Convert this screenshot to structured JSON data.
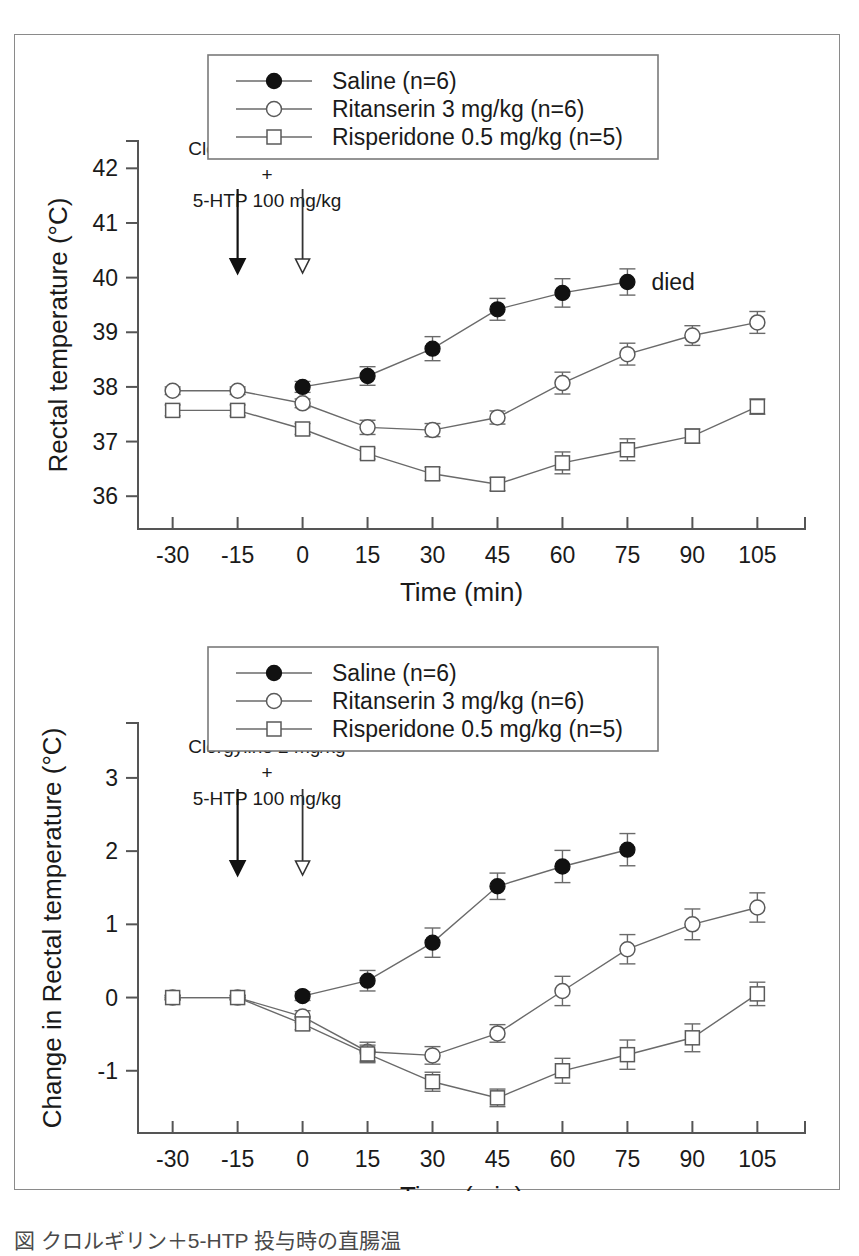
{
  "figure": {
    "caption_partial": "図  クロルギリン＋5-HTP 投与時の直腸温"
  },
  "chart_data": [
    {
      "id": "top",
      "type": "line",
      "title": "",
      "xlabel": "Time (min)",
      "ylabel": "Rectal temperature (°C)",
      "x": [
        -30,
        -15,
        0,
        15,
        30,
        45,
        60,
        75,
        90,
        105
      ],
      "xtick_labels": [
        "-30",
        "-15",
        "0",
        "15",
        "30",
        "45",
        "60",
        "75",
        "90",
        "105"
      ],
      "ytick_labels": [
        "36",
        "37",
        "38",
        "39",
        "40",
        "41",
        "42"
      ],
      "yticks": [
        36,
        37,
        38,
        39,
        40,
        41,
        42
      ],
      "xlim": [
        -38,
        116
      ],
      "ylim": [
        35.4,
        42.5
      ],
      "grid": false,
      "legend_position": "top-center",
      "series": [
        {
          "name": "Saline (n=6)",
          "marker": "filled-circle",
          "x": [
            0,
            15,
            30,
            45,
            60,
            75
          ],
          "values": [
            38.0,
            38.2,
            38.7,
            39.42,
            39.72,
            39.92
          ],
          "errors": [
            0.1,
            0.17,
            0.22,
            0.2,
            0.26,
            0.24
          ]
        },
        {
          "name": "Ritanserin 3 mg/kg (n=6)",
          "marker": "open-circle",
          "x": [
            -30,
            -15,
            0,
            15,
            30,
            45,
            60,
            75,
            90,
            105
          ],
          "values": [
            37.93,
            37.93,
            37.7,
            37.26,
            37.21,
            37.44,
            38.07,
            38.6,
            38.94,
            39.18
          ],
          "errors": [
            0.07,
            0.07,
            0.08,
            0.13,
            0.12,
            0.12,
            0.2,
            0.2,
            0.18,
            0.2
          ]
        },
        {
          "name": "Risperidone 0.5 mg/kg (n=5)",
          "marker": "open-square",
          "x": [
            -30,
            -15,
            0,
            15,
            30,
            45,
            60,
            75,
            90,
            105
          ],
          "values": [
            37.57,
            37.57,
            37.23,
            36.78,
            36.41,
            36.22,
            36.61,
            36.85,
            37.1,
            37.64
          ],
          "errors": [
            0.1,
            0.1,
            0.1,
            0.1,
            0.12,
            0.12,
            0.2,
            0.2,
            0.13,
            0.14
          ]
        }
      ],
      "annotations": [
        {
          "name": "drug-label",
          "text_lines": [
            "Clorgyline 2 mg/kg",
            "+",
            "5-HTP 100 mg/kg"
          ]
        },
        {
          "name": "died-label",
          "text": "died",
          "at_x": 75,
          "at_y": 39.92
        }
      ],
      "arrows": [
        {
          "name": "arrow-pretreatment",
          "style": "solid",
          "x": -15
        },
        {
          "name": "arrow-challenge",
          "style": "open",
          "x": 0
        }
      ]
    },
    {
      "id": "bottom",
      "type": "line",
      "title": "",
      "xlabel": "Time (min)",
      "ylabel": "Change in Rectal temperature (°C)",
      "x": [
        -30,
        -15,
        0,
        15,
        30,
        45,
        60,
        75,
        90,
        105
      ],
      "xtick_labels": [
        "-30",
        "-15",
        "0",
        "15",
        "30",
        "45",
        "60",
        "75",
        "90",
        "105"
      ],
      "ytick_labels": [
        "-1",
        "0",
        "1",
        "2",
        "3"
      ],
      "yticks": [
        -1,
        0,
        1,
        2,
        3
      ],
      "xlim": [
        -38,
        116
      ],
      "ylim": [
        -1.85,
        3.75
      ],
      "grid": false,
      "legend_position": "top-center",
      "series": [
        {
          "name": "Saline (n=6)",
          "marker": "filled-circle",
          "x": [
            0,
            15,
            30,
            45,
            60,
            75
          ],
          "values": [
            0.02,
            0.23,
            0.75,
            1.52,
            1.79,
            2.02
          ],
          "errors": [
            0.06,
            0.14,
            0.2,
            0.18,
            0.22,
            0.22
          ]
        },
        {
          "name": "Ritanserin 3 mg/kg (n=6)",
          "marker": "open-circle",
          "x": [
            -30,
            -15,
            0,
            15,
            30,
            45,
            60,
            75,
            90,
            105
          ],
          "values": [
            0.0,
            0.0,
            -0.26,
            -0.74,
            -0.79,
            -0.49,
            0.09,
            0.66,
            1.0,
            1.23
          ],
          "errors": [
            0.03,
            0.03,
            0.08,
            0.13,
            0.12,
            0.12,
            0.2,
            0.2,
            0.21,
            0.2
          ]
        },
        {
          "name": "Risperidone 0.5 mg/kg (n=5)",
          "marker": "open-square",
          "x": [
            -30,
            -15,
            0,
            15,
            30,
            45,
            60,
            75,
            90,
            105
          ],
          "values": [
            0.0,
            0.0,
            -0.36,
            -0.77,
            -1.15,
            -1.37,
            -1.0,
            -0.78,
            -0.55,
            0.05
          ],
          "errors": [
            0.03,
            0.03,
            0.08,
            0.12,
            0.13,
            0.12,
            0.17,
            0.2,
            0.19,
            0.16
          ]
        }
      ],
      "annotations": [
        {
          "name": "drug-label",
          "text_lines": [
            "Clorgyline 2 mg/kg",
            "+",
            "5-HTP 100 mg/kg"
          ]
        }
      ],
      "arrows": [
        {
          "name": "arrow-pretreatment",
          "style": "solid",
          "x": -15
        },
        {
          "name": "arrow-challenge",
          "style": "open",
          "x": 0
        }
      ]
    }
  ],
  "legend": {
    "entries": [
      {
        "label": "Saline (n=6)",
        "marker": "filled-circle"
      },
      {
        "label": "Ritanserin 3 mg/kg (n=6)",
        "marker": "open-circle"
      },
      {
        "label": "Risperidone 0.5 mg/kg (n=5)",
        "marker": "open-square"
      }
    ]
  }
}
